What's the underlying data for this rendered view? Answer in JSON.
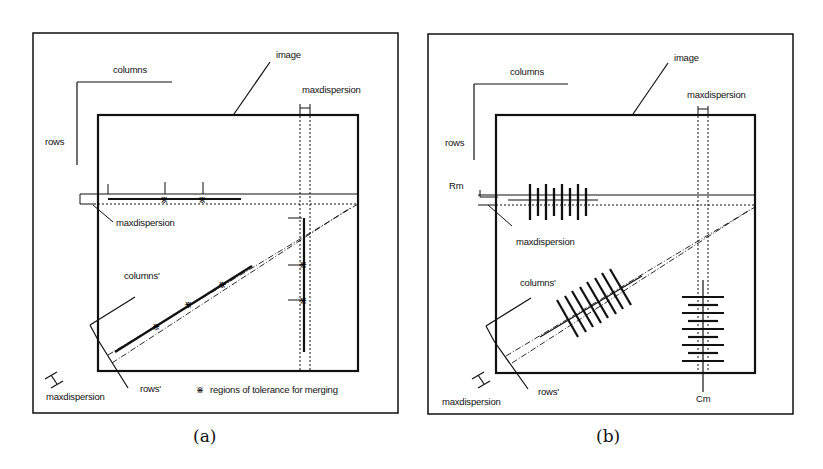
{
  "figure": {
    "panels": [
      {
        "id": "a",
        "caption": "(a)",
        "labels": {
          "columns": "columns",
          "rows": "rows",
          "image": "image",
          "maxdispersion_top": "maxdispersion",
          "maxdispersion_left": "maxdispersion",
          "maxdispersion_bottom": "maxdispersion",
          "columns_prime": "columns'",
          "rows_prime": "rows'",
          "legend": "regions of tolerance for merging"
        },
        "legend_symbol": "crosshatch-marker"
      },
      {
        "id": "b",
        "caption": "(b)",
        "labels": {
          "columns": "columns",
          "rows": "rows",
          "image": "image",
          "maxdispersion_top": "maxdispersion",
          "maxdispersion_left": "maxdispersion",
          "maxdispersion_bottom": "maxdispersion",
          "columns_prime": "columns'",
          "rows_prime": "rows'",
          "rm": "Rm",
          "cm": "Cm"
        }
      }
    ]
  },
  "colors": {
    "ink": "#111111",
    "background": "#ffffff"
  }
}
